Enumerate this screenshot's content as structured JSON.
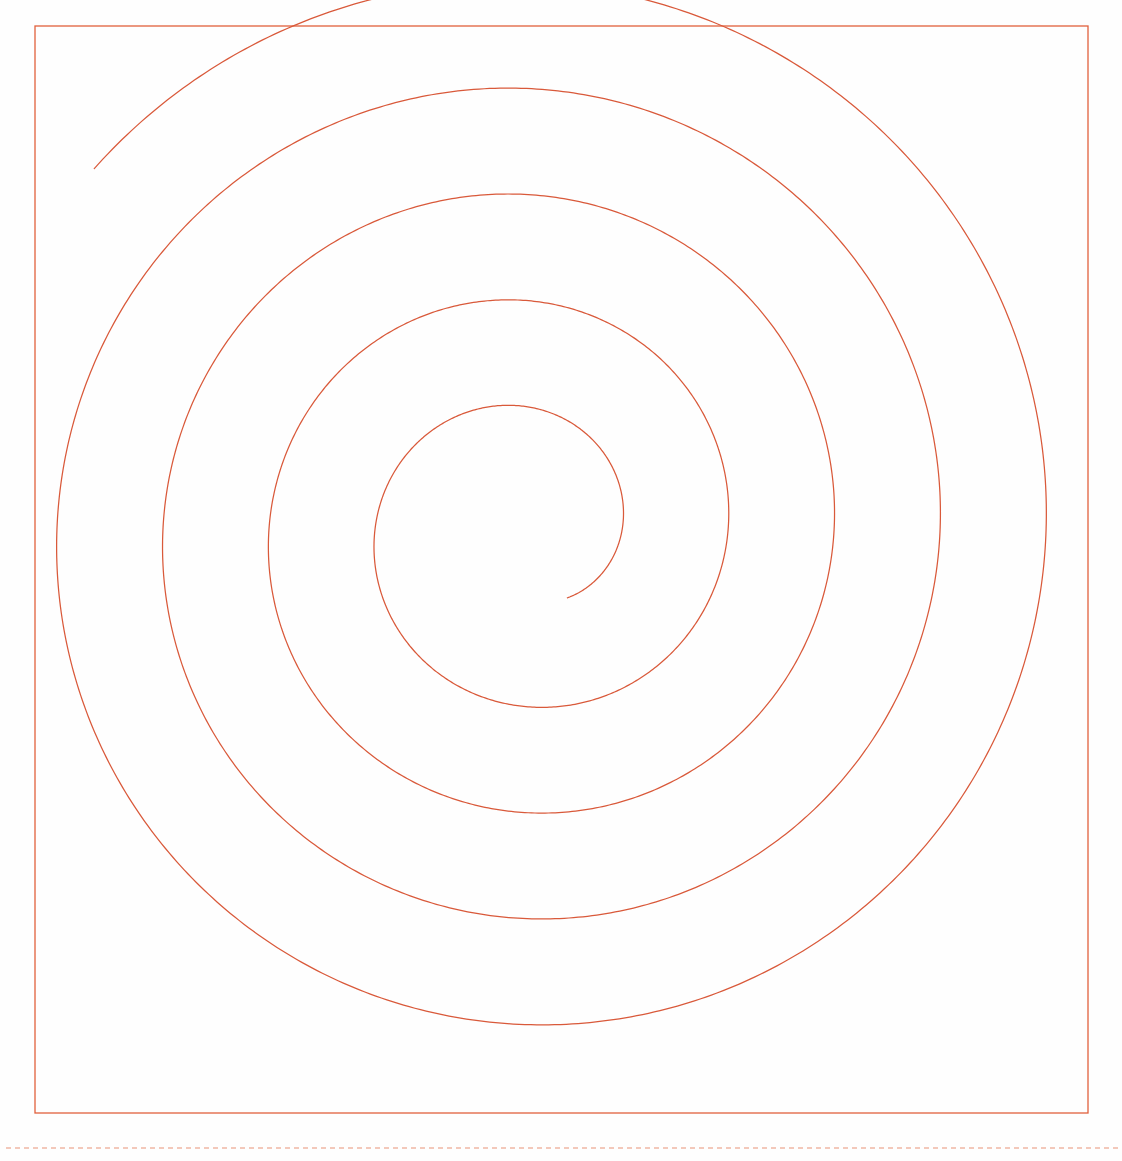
{
  "page": {
    "width": 1122,
    "height": 1161,
    "background_color": "#fefefe"
  },
  "colors": {
    "stroke_accent": "#e0603c",
    "frame_border": "#e0603c",
    "spiral_stroke": "#d9593a",
    "dotted_rule": "#f0b6a4",
    "background": "#fefefe"
  },
  "frame": {
    "name": "canvas-frame",
    "x": 35,
    "y": 26,
    "width": 1053,
    "height": 1087,
    "stroke_width": 1.3,
    "stroke_color": "#e0603c"
  },
  "dotted_rule": {
    "name": "baseline-dotted-rule",
    "y": 1148,
    "x_start": 6,
    "x_end": 1118,
    "stroke_width": 1.4,
    "stroke_color": "#f0b6a4",
    "dash_pattern": "5 4"
  },
  "chart_data": {
    "type": "line",
    "xlabel": "",
    "ylabel": "",
    "grid": false,
    "legend": null,
    "xlim": [
      0,
      1122
    ],
    "ylim": [
      0,
      1161
    ],
    "annotations": [],
    "series": [
      {
        "name": "spiral",
        "curve": "archimedean",
        "center": {
          "x": 525,
          "y": 530
        },
        "inner_endpoint": {
          "x": 568,
          "y": 600
        },
        "outer_endpoint": {
          "x": 951,
          "y": 224
        },
        "start_radius": 80,
        "growth_per_turn": 106,
        "turns": 4.55,
        "start_angle_deg": 58,
        "direction": "counterclockwise",
        "stroke_color": "#d9593a",
        "stroke_width": 1.25,
        "radius_crossings_left": [
          120,
          228,
          331,
          442
        ],
        "radius_crossings_right": [
          95,
          192,
          300,
          408,
          515
        ],
        "radius_crossings_up": [
          100,
          204,
          303,
          417
        ],
        "radius_crossings_down": [
          163,
          276,
          382,
          505
        ]
      }
    ]
  }
}
